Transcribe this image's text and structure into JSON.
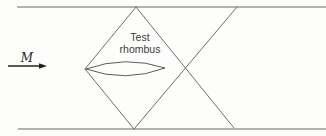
{
  "diagram": {
    "type": "supersonic-wind-tunnel-test-section-schematic",
    "labels": {
      "mach": "M",
      "test_region_line1": "Test",
      "test_region_line2": "rhombus"
    },
    "colors": {
      "background": "#fdfdfc",
      "wall": "#9a9a9a",
      "shock_line": "#6e6e6e",
      "model_outline": "#5c5c5c",
      "text": "#3c3c3c",
      "arrow": "#222222"
    },
    "geometry": {
      "canvas": {
        "width": 326,
        "height": 136
      },
      "walls": [
        {
          "name": "top-wall",
          "x1": 17,
          "y1": 7,
          "x2": 326,
          "y2": 7
        },
        {
          "name": "bottom-wall",
          "x1": 18,
          "y1": 129,
          "x2": 326,
          "y2": 129
        }
      ],
      "shocks": [
        {
          "name": "bow-shock-upper",
          "x1": 85,
          "y1": 69,
          "x2": 136,
          "y2": 7
        },
        {
          "name": "bow-shock-lower",
          "x1": 85,
          "y1": 69,
          "x2": 134,
          "y2": 129
        },
        {
          "name": "reflected-shock-upper",
          "x1": 136,
          "y1": 7,
          "x2": 234,
          "y2": 128
        },
        {
          "name": "reflected-shock-lower",
          "x1": 134,
          "y1": 129,
          "x2": 237,
          "y2": 7
        }
      ],
      "airfoil": {
        "x_left": 86,
        "x_right": 165,
        "y_mid": 69,
        "half_thickness": 7
      },
      "flow_arrow": {
        "x_start": 8,
        "x_tip": 47,
        "y": 66
      }
    }
  }
}
